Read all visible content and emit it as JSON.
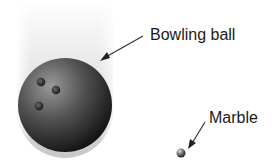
{
  "diagram": {
    "objects": [
      {
        "id": "bowling-ball",
        "label": "Bowling ball"
      },
      {
        "id": "marble",
        "label": "Marble"
      }
    ],
    "colors": {
      "ball_dark": "#1c1c1c",
      "ball_light": "#8a8a8a",
      "text": "#1a1a1a",
      "arrow": "#333333"
    }
  }
}
